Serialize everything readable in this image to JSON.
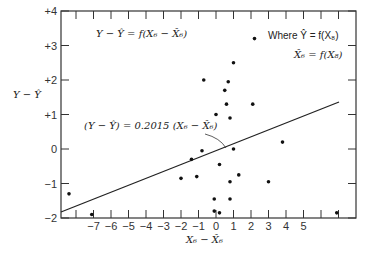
{
  "chart_data": {
    "type": "scatter",
    "title": "",
    "xlabel": "X6 − X̂6",
    "ylabel": "Y − Ŷ",
    "xlim": [
      -8.8,
      8
    ],
    "ylim": [
      -2,
      4
    ],
    "grid": false,
    "x_ticks": [
      "-7",
      "-6",
      "-5",
      "-4",
      "-3",
      "-2",
      "-1",
      "0",
      "1",
      "2",
      "3",
      "4",
      "5"
    ],
    "y_ticks": [
      "+4",
      "+3",
      "+2",
      "+1",
      "0",
      "-1",
      "-2"
    ],
    "annotations": {
      "top_left": "Y − Ŷ = f(X6 − X̂6)",
      "top_right_1": "Where Ŷ = f(X8)",
      "top_right_2": "X̂6 = f(X8)",
      "regression": "(Y − Ŷ) = 0.2015 (X6 − X̂6)"
    },
    "regression_line": {
      "slope": 0.2015,
      "intercept": 0,
      "x_range": [
        -8.8,
        7.1
      ]
    },
    "points": [
      {
        "x": -8.4,
        "y": -1.3
      },
      {
        "x": -7.1,
        "y": -1.9
      },
      {
        "x": -2.0,
        "y": -0.85
      },
      {
        "x": -1.4,
        "y": -0.3
      },
      {
        "x": -1.1,
        "y": -0.8
      },
      {
        "x": -0.8,
        "y": -0.05
      },
      {
        "x": -0.7,
        "y": 2.0
      },
      {
        "x": 0.0,
        "y": 1.0
      },
      {
        "x": 0.2,
        "y": -0.45
      },
      {
        "x": -0.1,
        "y": -1.45
      },
      {
        "x": -0.1,
        "y": -1.8
      },
      {
        "x": 0.2,
        "y": -1.85
      },
      {
        "x": 0.5,
        "y": 1.7
      },
      {
        "x": 0.6,
        "y": 1.3
      },
      {
        "x": 0.7,
        "y": 1.95
      },
      {
        "x": 0.8,
        "y": 0.9
      },
      {
        "x": 1.0,
        "y": 2.5
      },
      {
        "x": 0.8,
        "y": -1.45
      },
      {
        "x": 0.8,
        "y": -0.95
      },
      {
        "x": 1.3,
        "y": -0.75
      },
      {
        "x": 1.0,
        "y": 0.0
      },
      {
        "x": 2.2,
        "y": 3.2
      },
      {
        "x": 2.1,
        "y": 1.3
      },
      {
        "x": 3.0,
        "y": -0.95
      },
      {
        "x": 3.8,
        "y": 0.2
      },
      {
        "x": 6.9,
        "y": -1.85
      }
    ]
  }
}
